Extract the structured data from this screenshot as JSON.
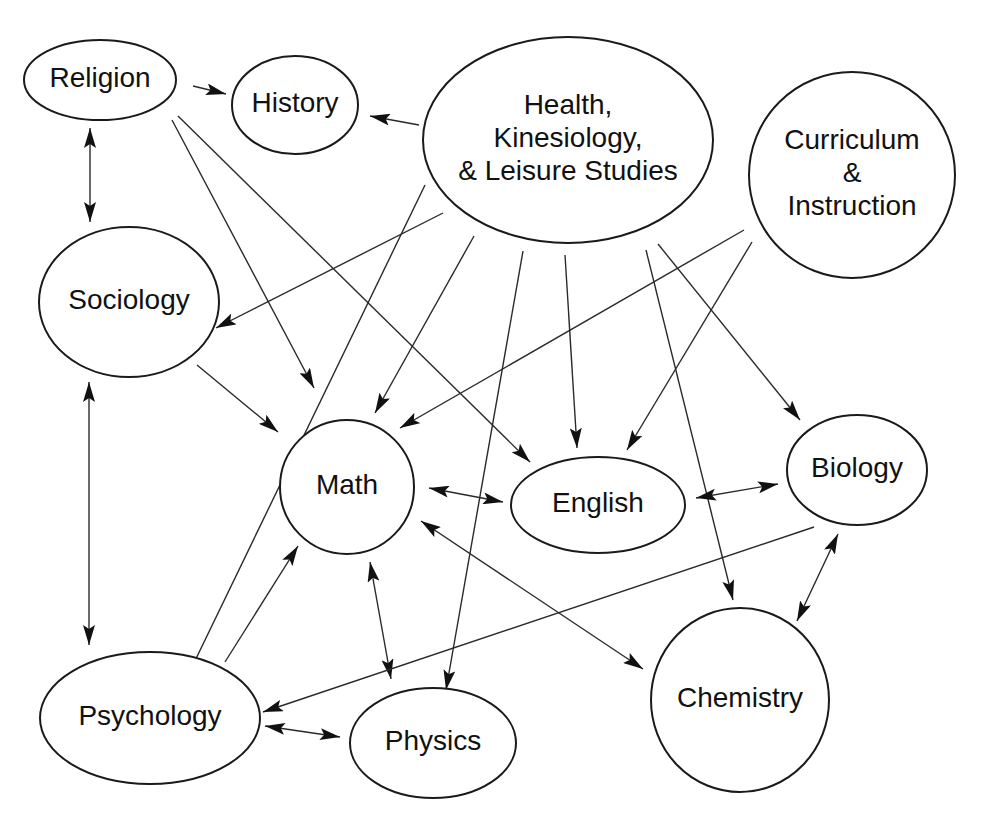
{
  "diagram": {
    "type": "directed-graph",
    "colors": {
      "stroke": "#1a1a1a",
      "text": "#111111",
      "background": "#ffffff"
    },
    "nodes": [
      {
        "id": "religion",
        "lines": [
          "Religion"
        ],
        "cx": 100,
        "cy": 80,
        "rx": 76,
        "ry": 40
      },
      {
        "id": "history",
        "lines": [
          "History"
        ],
        "cx": 295,
        "cy": 105,
        "rx": 63,
        "ry": 49
      },
      {
        "id": "health",
        "lines": [
          "Health,",
          "Kinesiology,",
          "& Leisure Studies"
        ],
        "cx": 568,
        "cy": 140,
        "rx": 145,
        "ry": 103
      },
      {
        "id": "curriculum",
        "lines": [
          "Curriculum",
          "&",
          "Instruction"
        ],
        "cx": 852,
        "cy": 175,
        "rx": 103,
        "ry": 103
      },
      {
        "id": "sociology",
        "lines": [
          "Sociology"
        ],
        "cx": 129,
        "cy": 302,
        "rx": 90,
        "ry": 75
      },
      {
        "id": "math",
        "lines": [
          "Math"
        ],
        "cx": 347,
        "cy": 487,
        "rx": 67,
        "ry": 67
      },
      {
        "id": "english",
        "lines": [
          "English"
        ],
        "cx": 598,
        "cy": 505,
        "rx": 87,
        "ry": 48
      },
      {
        "id": "biology",
        "lines": [
          "Biology"
        ],
        "cx": 857,
        "cy": 470,
        "rx": 70,
        "ry": 55
      },
      {
        "id": "psychology",
        "lines": [
          "Psychology"
        ],
        "cx": 150,
        "cy": 718,
        "rx": 110,
        "ry": 66
      },
      {
        "id": "physics",
        "lines": [
          "Physics"
        ],
        "cx": 433,
        "cy": 743,
        "rx": 83,
        "ry": 55
      },
      {
        "id": "chemistry",
        "lines": [
          "Chemistry"
        ],
        "cx": 740,
        "cy": 700,
        "rx": 89,
        "ry": 92
      }
    ],
    "edges": [
      {
        "from": "religion",
        "to": "history",
        "bidirectional": false,
        "x1": 193,
        "y1": 86,
        "x2": 226,
        "y2": 94
      },
      {
        "from": "health",
        "to": "history",
        "bidirectional": false,
        "x1": 419,
        "y1": 125,
        "x2": 370,
        "y2": 116
      },
      {
        "from": "religion",
        "to": "sociology",
        "bidirectional": true,
        "x1": 90,
        "y1": 128,
        "x2": 90,
        "y2": 222
      },
      {
        "from": "religion",
        "to": "math",
        "bidirectional": false,
        "x1": 172,
        "y1": 120,
        "x2": 314,
        "y2": 388
      },
      {
        "from": "religion",
        "to": "english",
        "bidirectional": false,
        "x1": 178,
        "y1": 116,
        "x2": 530,
        "y2": 462
      },
      {
        "from": "health",
        "to": "sociology",
        "bidirectional": false,
        "x1": 443,
        "y1": 213,
        "x2": 216,
        "y2": 328
      },
      {
        "from": "health",
        "to": "psychology",
        "bidirectional": false,
        "x1": 425,
        "y1": 185,
        "x2": 176,
        "y2": 700
      },
      {
        "from": "health",
        "to": "math",
        "bidirectional": false,
        "x1": 474,
        "y1": 236,
        "x2": 375,
        "y2": 413
      },
      {
        "from": "health",
        "to": "physics",
        "bidirectional": false,
        "x1": 523,
        "y1": 251,
        "x2": 446,
        "y2": 690
      },
      {
        "from": "health",
        "to": "english",
        "bidirectional": false,
        "x1": 565,
        "y1": 255,
        "x2": 577,
        "y2": 448
      },
      {
        "from": "health",
        "to": "chemistry",
        "bidirectional": false,
        "x1": 646,
        "y1": 250,
        "x2": 733,
        "y2": 600
      },
      {
        "from": "health",
        "to": "biology",
        "bidirectional": false,
        "x1": 658,
        "y1": 244,
        "x2": 800,
        "y2": 420
      },
      {
        "from": "curriculum",
        "to": "math",
        "bidirectional": false,
        "x1": 744,
        "y1": 230,
        "x2": 400,
        "y2": 428
      },
      {
        "from": "curriculum",
        "to": "english",
        "bidirectional": false,
        "x1": 752,
        "y1": 242,
        "x2": 627,
        "y2": 450
      },
      {
        "from": "sociology",
        "to": "math",
        "bidirectional": false,
        "x1": 197,
        "y1": 365,
        "x2": 278,
        "y2": 432
      },
      {
        "from": "sociology",
        "to": "psychology",
        "bidirectional": true,
        "x1": 89,
        "y1": 382,
        "x2": 89,
        "y2": 645
      },
      {
        "from": "psychology",
        "to": "math",
        "bidirectional": false,
        "x1": 225,
        "y1": 662,
        "x2": 298,
        "y2": 546
      },
      {
        "from": "math",
        "to": "english",
        "bidirectional": true,
        "x1": 429,
        "y1": 488,
        "x2": 503,
        "y2": 502
      },
      {
        "from": "english",
        "to": "biology",
        "bidirectional": true,
        "x1": 696,
        "y1": 498,
        "x2": 778,
        "y2": 484
      },
      {
        "from": "math",
        "to": "physics",
        "bidirectional": true,
        "x1": 370,
        "y1": 562,
        "x2": 391,
        "y2": 679
      },
      {
        "from": "math",
        "to": "chemistry",
        "bidirectional": true,
        "x1": 421,
        "y1": 521,
        "x2": 643,
        "y2": 669
      },
      {
        "from": "biology",
        "to": "chemistry",
        "bidirectional": true,
        "x1": 838,
        "y1": 534,
        "x2": 797,
        "y2": 621
      },
      {
        "from": "biology",
        "to": "psychology",
        "bidirectional": false,
        "x1": 814,
        "y1": 527,
        "x2": 263,
        "y2": 712
      },
      {
        "from": "psychology",
        "to": "physics",
        "bidirectional": true,
        "x1": 265,
        "y1": 726,
        "x2": 340,
        "y2": 737
      }
    ]
  }
}
